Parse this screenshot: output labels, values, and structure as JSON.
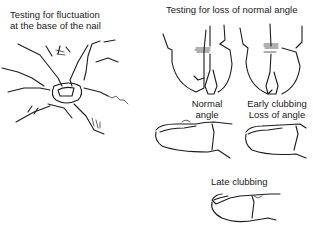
{
  "panels": {
    "fluctuation": {
      "title_line1": "Testing for fluctuation",
      "title_line2": "at the base of the nail",
      "signature": "Lafonn"
    },
    "angle": {
      "title": "Testing for loss of normal angle",
      "normal": {
        "line1": "Normal",
        "line2": "angle"
      },
      "early": {
        "line1": "Early clubbing",
        "line2": "Loss of angle"
      },
      "late": {
        "label": "Late clubbing"
      }
    }
  },
  "colors": {
    "ink": "#1c1c1c",
    "background": "#ffffff"
  }
}
